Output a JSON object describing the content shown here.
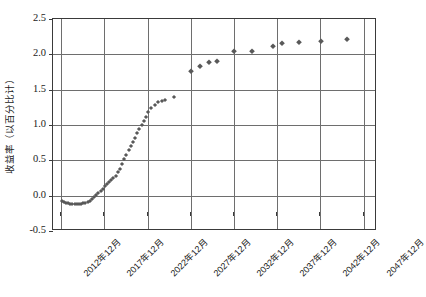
{
  "chart_data": {
    "type": "scatter",
    "title": "",
    "xlabel": "",
    "ylabel": "收益率（以百分比计）",
    "ylim": [
      -0.5,
      2.5
    ],
    "ytick_labels": [
      "2.5",
      "2.0",
      "1.5",
      "1.0",
      "0.5",
      "0.0",
      "-0.5"
    ],
    "ytick_values": [
      2.5,
      2.0,
      1.5,
      1.0,
      0.5,
      0.0,
      -0.5
    ],
    "xtick_labels": [
      "2012年12月",
      "2017年12月",
      "2022年12月",
      "2027年12月",
      "2032年12月",
      "2037年12月",
      "2042年12月",
      "2047年12月"
    ],
    "xtick_values": [
      2012.96,
      2017.96,
      2022.96,
      2027.96,
      2032.96,
      2037.96,
      2042.96,
      2047.96
    ],
    "xlim": [
      2012.0,
      2049.5
    ],
    "grid": true,
    "legend": "none",
    "marker": "diamond",
    "marker_color": "#595959",
    "series": [
      {
        "name": "收益率",
        "x": [
          2013.0,
          2013.25,
          2013.5,
          2013.75,
          2014.0,
          2014.25,
          2014.5,
          2014.75,
          2015.0,
          2015.25,
          2015.5,
          2015.75,
          2016.0,
          2016.25,
          2016.5,
          2016.75,
          2017.0,
          2017.25,
          2017.5,
          2017.75,
          2018.0,
          2018.25,
          2018.5,
          2018.75,
          2019.0,
          2019.25,
          2019.5,
          2019.75,
          2020.0,
          2020.25,
          2020.5,
          2020.75,
          2021.0,
          2021.25,
          2021.5,
          2021.75,
          2022.0,
          2022.25,
          2022.5,
          2022.75,
          2023.0,
          2023.4,
          2023.8,
          2024.2,
          2024.6,
          2025.0,
          2026.0,
          2028.0,
          2029.0,
          2030.0,
          2031.0,
          2033.0,
          2035.0,
          2037.5,
          2038.5,
          2040.5,
          2043.0,
          2046.0
        ],
        "y": [
          -0.07,
          -0.09,
          -0.1,
          -0.11,
          -0.12,
          -0.12,
          -0.12,
          -0.12,
          -0.12,
          -0.12,
          -0.11,
          -0.1,
          -0.09,
          -0.07,
          -0.05,
          -0.02,
          0.01,
          0.04,
          0.07,
          0.1,
          0.13,
          0.16,
          0.19,
          0.22,
          0.25,
          0.28,
          0.33,
          0.38,
          0.45,
          0.52,
          0.58,
          0.64,
          0.7,
          0.76,
          0.82,
          0.88,
          0.94,
          1.0,
          1.06,
          1.12,
          1.18,
          1.24,
          1.29,
          1.32,
          1.34,
          1.35,
          1.39,
          1.77,
          1.83,
          1.89,
          1.9,
          2.05,
          2.05,
          2.12,
          2.16,
          2.18,
          2.19,
          2.22
        ]
      }
    ]
  }
}
